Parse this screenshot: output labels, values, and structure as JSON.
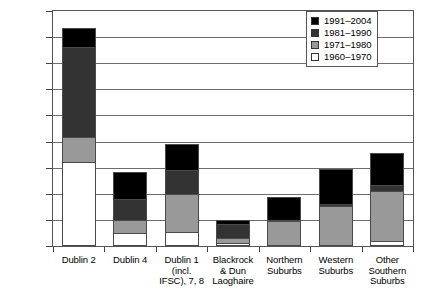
{
  "chart_data": {
    "type": "bar",
    "subtype": "stacked-vertical-bar",
    "title": "",
    "xlabel": "",
    "ylabel": "",
    "ylim": [
      0,
      1800000
    ],
    "ytick_step": 200000,
    "ytick_labels": [
      "1800000",
      "1600000",
      "1400000",
      "1200000",
      "1000000",
      "800000",
      "600000",
      "400000",
      "200000",
      "0"
    ],
    "grid": true,
    "legend_position": "top-right",
    "categories": [
      "Dublin 2",
      "Dublin 4",
      "Dublin 1\n(incl.\nIFSC), 7, 8",
      "Blackrock\n& Dun\nLaoghaire",
      "Northern\nSuburbs",
      "Western\nSuburbs",
      "Other\nSouthern\nSuburbs"
    ],
    "series": [
      {
        "name": "1960–1970",
        "color": "#ffffff",
        "values": [
          640000,
          100000,
          105000,
          20000,
          0,
          0,
          40000
        ]
      },
      {
        "name": "1971–1980",
        "color": "#999999",
        "values": [
          195000,
          100000,
          290000,
          45000,
          190000,
          310000,
          385000
        ]
      },
      {
        "name": "1981–1990",
        "color": "#333333",
        "values": [
          690000,
          160000,
          190000,
          100000,
          10000,
          15000,
          40000
        ]
      },
      {
        "name": "1991–2004",
        "color": "#000000",
        "values": [
          145000,
          205000,
          195000,
          35000,
          175000,
          265000,
          250000
        ]
      }
    ],
    "totals": [
      1670000,
      565000,
      780000,
      200000,
      375000,
      590000,
      715000
    ]
  },
  "legend": {
    "items": [
      {
        "label": "1991–2004",
        "color": "#000000"
      },
      {
        "label": "1981–1990",
        "color": "#333333"
      },
      {
        "label": "1971–1980",
        "color": "#999999"
      },
      {
        "label": "1960–1970",
        "color": "#ffffff"
      }
    ]
  }
}
